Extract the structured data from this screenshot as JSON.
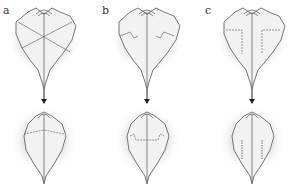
{
  "figure": {
    "panels": [
      {
        "label": "a",
        "fold_style": "diagonal-cross"
      },
      {
        "label": "b",
        "fold_style": "stepped-side"
      },
      {
        "label": "c",
        "fold_style": "vertical-dashed"
      }
    ],
    "arrow": "down-arrow",
    "colors": {
      "line": "#555555",
      "shade": "#d8d8d8",
      "fill": "#f2f2f2"
    }
  }
}
